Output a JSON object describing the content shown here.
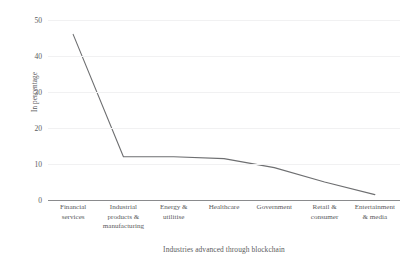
{
  "chart_data": {
    "type": "line",
    "title": "",
    "subtitle": "",
    "xlabel": "Industries advanced through blockchain",
    "ylabel": "In percentage",
    "categories": [
      "Financial services",
      "Industrial products & manufacturing",
      "Energy & utilitise",
      "Healthcare",
      "Government",
      "Retail & consumer",
      "Entertainment & media"
    ],
    "category_lines": [
      [
        "Financial",
        "services"
      ],
      [
        "Industrial",
        "products &",
        "manufacturing"
      ],
      [
        "Energy &",
        "utilitise"
      ],
      [
        "Healthcare"
      ],
      [
        "Government"
      ],
      [
        "Retail &",
        "consumer"
      ],
      [
        "Entertainment",
        "& media"
      ]
    ],
    "values": [
      46,
      12,
      12,
      11.5,
      9,
      5,
      1.5
    ],
    "ylim": [
      0,
      50
    ],
    "yticks": [
      0,
      10,
      20,
      30,
      40,
      50
    ],
    "ytick_labels": [
      "0",
      "10",
      "20",
      "30",
      "40",
      "50"
    ],
    "grid": true,
    "legend": false,
    "legend_position": "none",
    "series_color": "#6e6f71",
    "gridline_color": "#f1f1f2",
    "axis_color": "#8a8b8d",
    "text_color": "#5a5b5d",
    "background": "#ffffff"
  }
}
